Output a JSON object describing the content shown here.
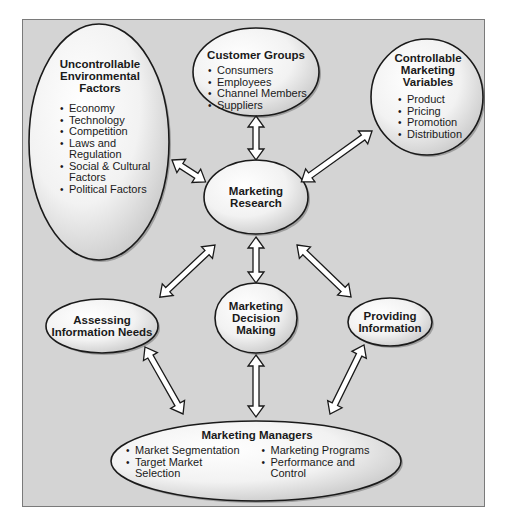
{
  "diagram": {
    "title": "",
    "colors": {
      "background": "#d4d4d4",
      "frame_border": "#7a7a7a",
      "ellipse_fill_light": "#ffffff",
      "ellipse_fill_dark": "#c8c8c8",
      "outline": "#1a1a1a",
      "arrow_fill": "#ffffff"
    },
    "nodes": {
      "uncontrollable": {
        "title_lines": [
          "Uncontrollable",
          "Environmental",
          "Factors"
        ],
        "items": [
          "Economy",
          "Technology",
          "Competition",
          "Laws and Regulation",
          "Social & Cultural Factors",
          "Political Factors"
        ]
      },
      "customer_groups": {
        "title": "Customer Groups",
        "items": [
          "Consumers",
          "Employees",
          "Channel Members",
          "Suppliers"
        ]
      },
      "controllable": {
        "title_lines": [
          "Controllable",
          "Marketing",
          "Variables"
        ],
        "items": [
          "Product",
          "Pricing",
          "Promotion",
          "Distribution"
        ]
      },
      "marketing_research": {
        "title_lines": [
          "Marketing",
          "Research"
        ]
      },
      "assessing": {
        "title_lines": [
          "Assessing",
          "Information Needs"
        ]
      },
      "decision_making": {
        "title_lines": [
          "Marketing",
          "Decision",
          "Making"
        ]
      },
      "providing": {
        "title_lines": [
          "Providing",
          "Information"
        ]
      },
      "managers": {
        "title": "Marketing Managers",
        "items_left": [
          "Market Segmentation",
          "Target Market Selection"
        ],
        "items_right": [
          "Marketing Programs",
          "Performance and Control"
        ]
      }
    },
    "edges": [
      {
        "from": "uncontrollable",
        "to": "marketing_research",
        "type": "bidirectional"
      },
      {
        "from": "customer_groups",
        "to": "marketing_research",
        "type": "bidirectional"
      },
      {
        "from": "controllable",
        "to": "marketing_research",
        "type": "bidirectional"
      },
      {
        "from": "marketing_research",
        "to": "assessing",
        "type": "bidirectional"
      },
      {
        "from": "marketing_research",
        "to": "decision_making",
        "type": "bidirectional"
      },
      {
        "from": "marketing_research",
        "to": "providing",
        "type": "bidirectional"
      },
      {
        "from": "assessing",
        "to": "managers",
        "type": "bidirectional"
      },
      {
        "from": "decision_making",
        "to": "managers",
        "type": "bidirectional"
      },
      {
        "from": "providing",
        "to": "managers",
        "type": "bidirectional"
      }
    ]
  }
}
